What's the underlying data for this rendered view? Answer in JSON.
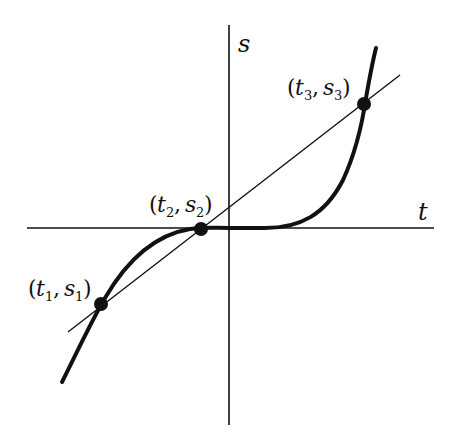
{
  "figure": {
    "axes": {
      "horizontal_label": "t",
      "vertical_label": "s"
    },
    "points": [
      {
        "id": "p1",
        "t_label": "t",
        "t_sub": "1",
        "s_label": "s",
        "s_sub": "1",
        "text": "(t1, s1)"
      },
      {
        "id": "p2",
        "t_label": "t",
        "t_sub": "2",
        "s_label": "s",
        "s_sub": "2",
        "text": "(t2, s2)"
      },
      {
        "id": "p3",
        "t_label": "t",
        "t_sub": "3",
        "s_label": "s",
        "s_sub": "3",
        "text": "(t3, s3)"
      }
    ],
    "curve_label": "s(t)",
    "line_label": "secant line",
    "colors": {
      "ink": "#111111",
      "background": "#ffffff"
    }
  }
}
